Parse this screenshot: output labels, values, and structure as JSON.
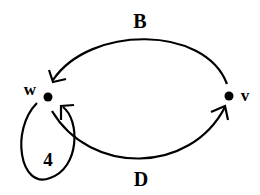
{
  "diagram": {
    "nodes": [
      {
        "id": "w",
        "label": "w"
      },
      {
        "id": "v",
        "label": "v"
      }
    ],
    "edges": [
      {
        "from": "v",
        "to": "w",
        "label": "B"
      },
      {
        "from": "w",
        "to": "v",
        "label": "D"
      },
      {
        "from": "w",
        "to": "w",
        "label": "4"
      }
    ],
    "colors": {
      "stroke": "#000000",
      "background": "#ffffff"
    }
  }
}
